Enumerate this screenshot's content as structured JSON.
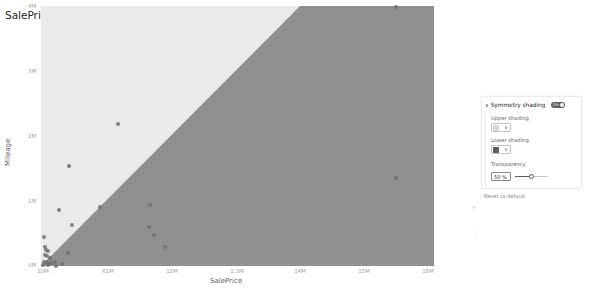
{
  "chart_data": {
    "type": "scatter",
    "title": "SalePrice and Mileage by Make",
    "xlabel": "SalePrice",
    "ylabel": "Mileage",
    "x_tick_labels": [
      "10M",
      "61M",
      "12M",
      "1.3M",
      "14M",
      "15M",
      "16M"
    ],
    "y_tick_labels": [
      "4M",
      "3M",
      "2M",
      "1M",
      "0M"
    ],
    "xlim": [
      10,
      16
    ],
    "ylim": [
      0,
      4
    ],
    "symmetry_shading": {
      "enabled": true,
      "upper_color": "#e6e6e6",
      "lower_color": "#8a8a8a",
      "transparency_pct": 50
    },
    "points_pixel": [
      [
        44,
        237
      ],
      [
        45,
        247
      ],
      [
        46,
        250
      ],
      [
        48,
        251
      ],
      [
        45,
        255
      ],
      [
        47,
        256
      ],
      [
        50,
        258
      ],
      [
        44,
        262
      ],
      [
        47,
        262
      ],
      [
        51,
        263
      ],
      [
        43,
        265
      ],
      [
        48,
        265
      ],
      [
        55,
        262
      ],
      [
        56,
        266
      ],
      [
        62,
        264
      ],
      [
        68,
        253
      ],
      [
        72,
        225
      ],
      [
        59,
        210
      ],
      [
        100,
        207
      ],
      [
        69,
        166
      ],
      [
        118,
        124
      ],
      [
        150,
        205
      ],
      [
        149,
        227
      ],
      [
        154,
        235
      ],
      [
        165,
        247
      ],
      [
        396,
        7
      ],
      [
        396,
        178
      ]
    ],
    "series": [
      {
        "name": "Make",
        "points": [
          {
            "x": 10.03,
            "y": 0.55
          },
          {
            "x": 10.04,
            "y": 0.35
          },
          {
            "x": 10.06,
            "y": 0.3
          },
          {
            "x": 10.08,
            "y": 0.28
          },
          {
            "x": 10.04,
            "y": 0.22
          },
          {
            "x": 10.06,
            "y": 0.2
          },
          {
            "x": 10.09,
            "y": 0.16
          },
          {
            "x": 10.03,
            "y": 0.1
          },
          {
            "x": 10.06,
            "y": 0.1
          },
          {
            "x": 10.1,
            "y": 0.08
          },
          {
            "x": 10.02,
            "y": 0.04
          },
          {
            "x": 10.07,
            "y": 0.04
          },
          {
            "x": 10.14,
            "y": 0.08
          },
          {
            "x": 10.15,
            "y": 0.02
          },
          {
            "x": 10.21,
            "y": 0.05
          },
          {
            "x": 10.27,
            "y": 0.25
          },
          {
            "x": 10.31,
            "y": 0.72
          },
          {
            "x": 10.18,
            "y": 0.98
          },
          {
            "x": 10.58,
            "y": 1.02
          },
          {
            "x": 10.28,
            "y": 1.7
          },
          {
            "x": 10.76,
            "y": 2.42
          },
          {
            "x": 11.07,
            "y": 1.05
          },
          {
            "x": 11.06,
            "y": 0.68
          },
          {
            "x": 11.11,
            "y": 0.55
          },
          {
            "x": 11.22,
            "y": 0.35
          },
          {
            "x": 15.42,
            "y": 3.95
          },
          {
            "x": 15.42,
            "y": 1.5
          }
        ]
      }
    ],
    "grid": false,
    "legend": "none"
  },
  "format_pane": {
    "section_title": "Symmetry shading",
    "toggle_label": "On",
    "upper_shading_label": "Upper shading",
    "lower_shading_label": "Lower shading",
    "upper_color": "#d9d9d9",
    "lower_color": "#605e5c",
    "transparency_label": "Transparency",
    "transparency_value": "50",
    "transparency_unit": "%",
    "reset_label": "Reset to default"
  }
}
